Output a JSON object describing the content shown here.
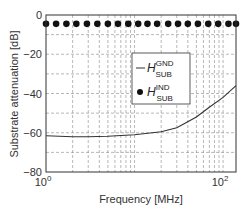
{
  "chart_data": {
    "type": "line",
    "title": "",
    "xlabel": "Frequency [MHz]",
    "ylabel": "Substrate attenuation [dB]",
    "xscale": "log",
    "xlim": [
      1,
      140
    ],
    "ylim": [
      -80,
      0
    ],
    "x_ticks": [
      {
        "value": 1,
        "label": "10",
        "exp": "0"
      },
      {
        "value": 100,
        "label": "10",
        "exp": "2"
      }
    ],
    "y_ticks": [
      0,
      -20,
      -40,
      -60,
      -80
    ],
    "grid": true,
    "legend_position": "center-right",
    "series": [
      {
        "name": "H_SUB^GND",
        "legend_main": "H",
        "legend_sup": "GND",
        "legend_sub": "SUB",
        "style": "line",
        "x": [
          1,
          2,
          3,
          5,
          10,
          20,
          30,
          50,
          70,
          100,
          140
        ],
        "y": [
          -61.5,
          -62,
          -62,
          -61.8,
          -61,
          -59.5,
          -57.5,
          -52,
          -47,
          -42,
          -36
        ]
      },
      {
        "name": "H_SUB^IND",
        "legend_main": "H",
        "legend_sup": "IND",
        "legend_sub": "SUB",
        "style": "markers",
        "x": [
          1,
          1.3,
          1.7,
          2.2,
          2.9,
          3.8,
          5,
          6.5,
          8.5,
          11,
          14,
          18,
          24,
          31,
          40,
          52,
          68,
          88,
          115,
          140
        ],
        "y": [
          -4.5,
          -4.5,
          -4.5,
          -4.5,
          -4.5,
          -4.5,
          -4.5,
          -4.5,
          -4.5,
          -4.5,
          -4.5,
          -4.5,
          -4.5,
          -4.5,
          -4.5,
          -4.5,
          -4.5,
          -4.5,
          -4.5,
          -4.5
        ]
      }
    ]
  }
}
